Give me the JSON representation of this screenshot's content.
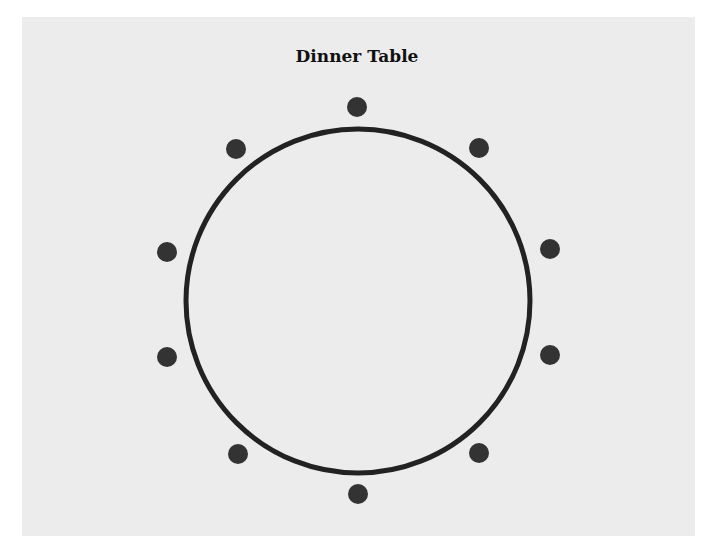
{
  "diagram": {
    "title": "Dinner Table",
    "background_color": "#ececec",
    "table": {
      "shape": "circle",
      "cx": 358,
      "cy": 301,
      "r": 172,
      "stroke_width": 5,
      "stroke_color": "#222222",
      "fill": "none"
    },
    "seats": {
      "count": 10,
      "radius": 10,
      "color": "#333333",
      "positions": [
        {
          "label": "seat-1",
          "x": 357,
          "y": 107
        },
        {
          "label": "seat-2",
          "x": 479,
          "y": 148
        },
        {
          "label": "seat-3",
          "x": 550,
          "y": 249
        },
        {
          "label": "seat-4",
          "x": 550,
          "y": 355
        },
        {
          "label": "seat-5",
          "x": 479,
          "y": 453
        },
        {
          "label": "seat-6",
          "x": 358,
          "y": 494
        },
        {
          "label": "seat-7",
          "x": 238,
          "y": 454
        },
        {
          "label": "seat-8",
          "x": 167,
          "y": 357
        },
        {
          "label": "seat-9",
          "x": 167,
          "y": 252
        },
        {
          "label": "seat-10",
          "x": 236,
          "y": 149
        }
      ]
    }
  }
}
